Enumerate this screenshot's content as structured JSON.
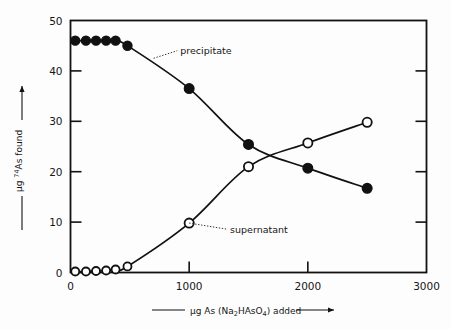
{
  "chart_data": {
    "type": "scatter",
    "title": "",
    "subtitle": "",
    "xlabel": "μg As (Na2HAsO4) added",
    "xlabel_parts": {
      "pre": "μg As  (Na",
      "sub1": "2",
      "mid": "HAsO",
      "sub2": "4",
      "post": ") added"
    },
    "ylabel": "μg 74As found",
    "ylabel_parts": {
      "pre": "μg ",
      "sup": "74",
      "post": "As  found"
    },
    "xlim": [
      0,
      3000
    ],
    "ylim": [
      0,
      50
    ],
    "xticks": [
      0,
      1000,
      2000,
      3000
    ],
    "xtick_labels": [
      "0",
      "1000",
      "2000",
      "3000"
    ],
    "yticks": [
      0,
      10,
      20,
      30,
      40,
      50
    ],
    "ytick_labels": [
      "0",
      "10",
      "20",
      "30",
      "40",
      "50"
    ],
    "grid": false,
    "legend_position": "inline-annotations",
    "series": [
      {
        "name": "precipitate",
        "marker": "filled-circle",
        "color": "#111111",
        "x": [
          40,
          130,
          215,
          300,
          380,
          480,
          1000,
          1500,
          2000,
          2500
        ],
        "y": [
          46.0,
          46.0,
          46.0,
          46.0,
          46.0,
          45.0,
          36.5,
          25.4,
          20.7,
          16.7
        ]
      },
      {
        "name": "supernatant",
        "marker": "open-circle",
        "color": "#111111",
        "x": [
          40,
          130,
          215,
          300,
          380,
          480,
          1000,
          1500,
          2000,
          2500
        ],
        "y": [
          0.2,
          0.2,
          0.3,
          0.4,
          0.6,
          1.2,
          9.8,
          21.0,
          25.7,
          29.8
        ]
      }
    ],
    "annotations": [
      {
        "text": "precipitate",
        "target_x": 700,
        "target_y": 42.5,
        "label_x": 900,
        "label_y": 44.0
      },
      {
        "text": "supernatant",
        "target_x": 1000,
        "target_y": 9.8,
        "label_x": 1320,
        "label_y": 8.6
      }
    ]
  },
  "axes": {
    "frame_color": "#111111",
    "tick_direction": "inward"
  }
}
